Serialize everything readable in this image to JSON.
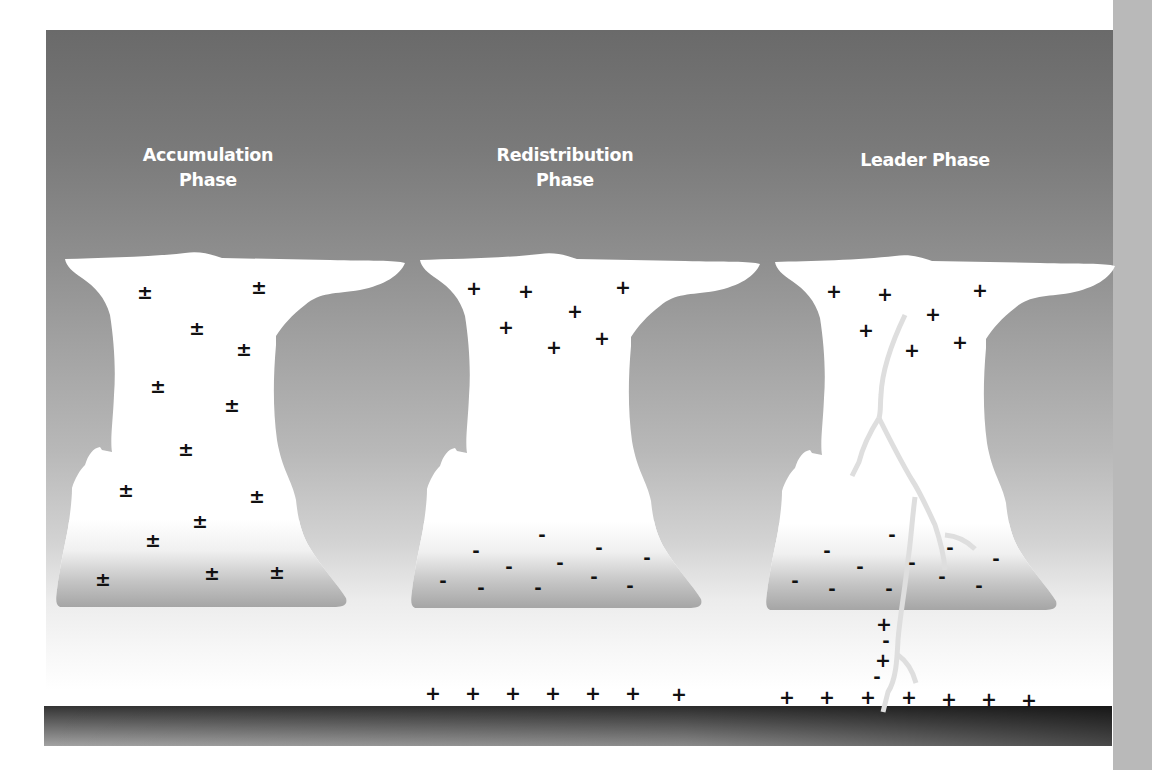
{
  "diagram": {
    "colors": {
      "panel_top": "#6a6a6a",
      "panel_bottom": "#ffffff",
      "cloud_fill": "#ffffff",
      "cloud_base_shade": "#a6a6a6",
      "leader": "#dcdcdc",
      "ground_dark": "#2e2e2e",
      "ground_light": "#9e9e9e",
      "right_strip": "#b9b9b9",
      "charge_color": "#111111"
    },
    "symbols": {
      "plus_minus": "±",
      "plus": "+",
      "minus": "-"
    }
  },
  "phases": [
    {
      "title": "Accumulation\nPhase",
      "title_pos": {
        "x": 208,
        "y": 145
      },
      "cloud_offset_x": 0,
      "charges": [
        {
          "s": "±",
          "x": 145,
          "y": 292
        },
        {
          "s": "±",
          "x": 259,
          "y": 287
        },
        {
          "s": "±",
          "x": 197,
          "y": 328
        },
        {
          "s": "±",
          "x": 244,
          "y": 349
        },
        {
          "s": "±",
          "x": 158,
          "y": 386
        },
        {
          "s": "±",
          "x": 232,
          "y": 405
        },
        {
          "s": "±",
          "x": 186,
          "y": 449
        },
        {
          "s": "±",
          "x": 126,
          "y": 490
        },
        {
          "s": "±",
          "x": 257,
          "y": 496
        },
        {
          "s": "±",
          "x": 200,
          "y": 521
        },
        {
          "s": "±",
          "x": 153,
          "y": 540
        },
        {
          "s": "±",
          "x": 103,
          "y": 579
        },
        {
          "s": "±",
          "x": 212,
          "y": 573
        },
        {
          "s": "±",
          "x": 277,
          "y": 572
        }
      ],
      "ground_charges": []
    },
    {
      "title": "Redistribution\nPhase",
      "title_pos": {
        "x": 565,
        "y": 145
      },
      "cloud_offset_x": 355,
      "charges": [
        {
          "s": "+",
          "x": 474,
          "y": 288
        },
        {
          "s": "+",
          "x": 526,
          "y": 291
        },
        {
          "s": "+",
          "x": 623,
          "y": 287
        },
        {
          "s": "+",
          "x": 575,
          "y": 311
        },
        {
          "s": "+",
          "x": 506,
          "y": 327
        },
        {
          "s": "+",
          "x": 554,
          "y": 347
        },
        {
          "s": "+",
          "x": 602,
          "y": 338
        },
        {
          "s": "-",
          "x": 542,
          "y": 535
        },
        {
          "s": "-",
          "x": 476,
          "y": 551
        },
        {
          "s": "-",
          "x": 599,
          "y": 548
        },
        {
          "s": "-",
          "x": 647,
          "y": 558
        },
        {
          "s": "-",
          "x": 509,
          "y": 567
        },
        {
          "s": "-",
          "x": 560,
          "y": 563
        },
        {
          "s": "-",
          "x": 443,
          "y": 581
        },
        {
          "s": "-",
          "x": 481,
          "y": 588
        },
        {
          "s": "-",
          "x": 538,
          "y": 588
        },
        {
          "s": "-",
          "x": 594,
          "y": 577
        },
        {
          "s": "-",
          "x": 630,
          "y": 586
        }
      ],
      "ground_charges": [
        {
          "s": "+",
          "x": 433,
          "y": 693
        },
        {
          "s": "+",
          "x": 473,
          "y": 693
        },
        {
          "s": "+",
          "x": 513,
          "y": 693
        },
        {
          "s": "+",
          "x": 553,
          "y": 693
        },
        {
          "s": "+",
          "x": 593,
          "y": 693
        },
        {
          "s": "+",
          "x": 633,
          "y": 693
        },
        {
          "s": "+",
          "x": 679,
          "y": 694
        }
      ]
    },
    {
      "title": "Leader Phase",
      "title_pos": {
        "x": 925,
        "y": 158
      },
      "cloud_offset_x": 710,
      "charges": [
        {
          "s": "+",
          "x": 834,
          "y": 291
        },
        {
          "s": "+",
          "x": 885,
          "y": 294
        },
        {
          "s": "+",
          "x": 980,
          "y": 290
        },
        {
          "s": "+",
          "x": 933,
          "y": 314
        },
        {
          "s": "+",
          "x": 866,
          "y": 330
        },
        {
          "s": "+",
          "x": 912,
          "y": 350
        },
        {
          "s": "+",
          "x": 960,
          "y": 342
        },
        {
          "s": "-",
          "x": 892,
          "y": 535
        },
        {
          "s": "-",
          "x": 827,
          "y": 551
        },
        {
          "s": "-",
          "x": 950,
          "y": 548
        },
        {
          "s": "-",
          "x": 996,
          "y": 559
        },
        {
          "s": "-",
          "x": 860,
          "y": 567
        },
        {
          "s": "-",
          "x": 912,
          "y": 563
        },
        {
          "s": "-",
          "x": 795,
          "y": 581
        },
        {
          "s": "-",
          "x": 832,
          "y": 589
        },
        {
          "s": "-",
          "x": 889,
          "y": 589
        },
        {
          "s": "-",
          "x": 942,
          "y": 577
        },
        {
          "s": "-",
          "x": 979,
          "y": 586
        }
      ],
      "channel_charges": [
        {
          "s": "+",
          "x": 884,
          "y": 624
        },
        {
          "s": "-",
          "x": 886,
          "y": 641
        },
        {
          "s": "+",
          "x": 883,
          "y": 660
        },
        {
          "s": "-",
          "x": 877,
          "y": 677
        }
      ],
      "ground_charges": [
        {
          "s": "+",
          "x": 787,
          "y": 697
        },
        {
          "s": "+",
          "x": 827,
          "y": 697
        },
        {
          "s": "+",
          "x": 868,
          "y": 697
        },
        {
          "s": "+",
          "x": 909,
          "y": 697
        },
        {
          "s": "+",
          "x": 949,
          "y": 699
        },
        {
          "s": "+",
          "x": 989,
          "y": 699
        },
        {
          "s": "+",
          "x": 1029,
          "y": 700
        }
      ]
    }
  ]
}
